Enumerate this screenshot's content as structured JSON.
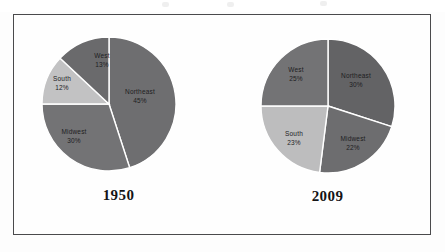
{
  "figure": {
    "frame_border_color": "#4a4a4c",
    "background": "#fefefe"
  },
  "charts": [
    {
      "id": "chart-1950",
      "year_label": "1950",
      "center": [
        68,
        68
      ],
      "radius": 67,
      "start_angle_deg": -90,
      "slices": [
        {
          "name": "Northeast",
          "value": 45,
          "label": "Northeast",
          "pct_label": "45%",
          "color": "#6e6e70",
          "label_x": 86,
          "label_y": 58
        },
        {
          "name": "Midwest",
          "value": 30,
          "label": "Midwest",
          "pct_label": "30%",
          "color": "#737375",
          "label_x": 19,
          "label_y": 98
        },
        {
          "name": "South",
          "value": 12,
          "label": "South",
          "pct_label": "12%",
          "color": "#c2c2c3",
          "label_x": 6,
          "label_y": 44
        },
        {
          "name": "West",
          "value": 13,
          "label": "West",
          "pct_label": "13%",
          "color": "#6a6a6c",
          "label_x": 47,
          "label_y": 21
        }
      ]
    },
    {
      "id": "chart-2009",
      "year_label": "2009",
      "center": [
        68,
        68
      ],
      "radius": 67,
      "start_angle_deg": -90,
      "slices": [
        {
          "name": "Northeast",
          "value": 30,
          "label": "Northeast",
          "pct_label": "30%",
          "color": "#636365",
          "label_x": 80,
          "label_y": 38
        },
        {
          "name": "Midwest",
          "value": 22,
          "label": "Midwest",
          "pct_label": "22%",
          "color": "#6d6d6f",
          "label_x": 77,
          "label_y": 103
        },
        {
          "name": "South",
          "value": 23,
          "label": "South",
          "pct_label": "23%",
          "color": "#bdbdbe",
          "label_x": 19,
          "label_y": 97
        },
        {
          "name": "West",
          "value": 25,
          "label": "West",
          "pct_label": "25%",
          "color": "#737375",
          "label_x": 21,
          "label_y": 32
        }
      ]
    }
  ],
  "chart_data": {
    "type": "pie",
    "title": "",
    "subtitle": "",
    "xlabel": "",
    "ylabel": "",
    "units": "percent",
    "legend_position": "none",
    "grid": false,
    "labels_inside_slices": true,
    "categories": [
      "Northeast",
      "Midwest",
      "South",
      "West"
    ],
    "panels": [
      {
        "panel_label": "1950",
        "values": [
          45,
          30,
          12,
          13
        ],
        "slice_colors": [
          "#6e6e70",
          "#737375",
          "#c2c2c3",
          "#6a6a6c"
        ],
        "data_labels": [
          "Northeast 45%",
          "Midwest 30%",
          "South 12%",
          "West 13%"
        ],
        "total": 100
      },
      {
        "panel_label": "2009",
        "values": [
          30,
          22,
          23,
          25
        ],
        "slice_colors": [
          "#636365",
          "#6d6d6f",
          "#bdbdbe",
          "#737375"
        ],
        "data_labels": [
          "Northeast 30%",
          "Midwest 22%",
          "South 23%",
          "West 25%"
        ],
        "total": 100
      }
    ],
    "series": [
      {
        "name": "1950",
        "values": [
          45,
          30,
          12,
          13
        ]
      },
      {
        "name": "2009",
        "values": [
          30,
          22,
          23,
          25
        ]
      }
    ]
  }
}
